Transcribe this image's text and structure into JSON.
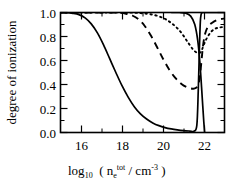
{
  "chart_data": {
    "type": "line",
    "title": "",
    "xlabel": "log10 ( n_e^tot / cm^-3 )",
    "ylabel": "degree of ionization",
    "xlim": [
      15,
      23
    ],
    "ylim": [
      0.0,
      1.0
    ],
    "grid": false,
    "legend": "none",
    "xticks": [
      16,
      18,
      20,
      22
    ],
    "xtick_labels": [
      "16",
      "18",
      "20",
      "22"
    ],
    "xminor_ticks": [
      15,
      17,
      19,
      21,
      23
    ],
    "yticks": [
      0.0,
      0.2,
      0.4,
      0.6,
      0.8,
      1.0
    ],
    "ytick_labels": [
      "0.0",
      "0.2",
      "0.4",
      "0.6",
      "0.8",
      "1.0"
    ],
    "yminor_ticks": [
      0.1,
      0.3,
      0.5,
      0.7,
      0.9
    ],
    "series": [
      {
        "name": "solid",
        "style": "solid",
        "x": [
          15.0,
          15.3,
          15.6,
          15.9,
          16.2,
          16.5,
          16.8,
          17.1,
          17.4,
          17.7,
          18.0,
          18.3,
          18.6,
          18.9,
          19.2,
          19.5,
          19.8,
          20.1,
          20.4,
          20.7,
          21.0,
          21.3,
          21.5,
          21.65,
          21.72,
          21.78,
          21.82,
          21.86,
          21.9,
          22.0,
          22.2,
          22.4,
          22.6,
          22.8,
          23.0
        ],
        "y": [
          1.0,
          0.998,
          0.993,
          0.982,
          0.955,
          0.905,
          0.83,
          0.73,
          0.615,
          0.5,
          0.39,
          0.295,
          0.215,
          0.155,
          0.112,
          0.08,
          0.057,
          0.041,
          0.03,
          0.022,
          0.016,
          0.012,
          0.01,
          0.06,
          0.35,
          0.72,
          0.92,
          0.985,
          0.998,
          1.0,
          1.0,
          1.0,
          1.0,
          1.0,
          1.0
        ]
      },
      {
        "name": "solid-descending-branch",
        "style": "solid",
        "x": [
          20.4,
          20.8,
          21.1,
          21.35,
          21.55,
          21.7,
          21.8,
          21.88,
          21.94,
          21.99,
          22.03
        ],
        "y": [
          1.0,
          1.0,
          0.995,
          0.97,
          0.9,
          0.76,
          0.58,
          0.38,
          0.22,
          0.09,
          0.0
        ]
      },
      {
        "name": "dashed",
        "style": "dashed",
        "x": [
          15.0,
          16.0,
          17.0,
          17.8,
          18.2,
          18.5,
          18.8,
          19.1,
          19.4,
          19.7,
          20.0,
          20.3,
          20.6,
          20.9,
          21.2,
          21.45,
          21.6,
          21.72,
          21.8,
          21.88,
          21.95,
          22.05,
          22.2,
          22.4,
          22.6,
          22.8,
          23.0
        ],
        "y": [
          1.0,
          1.0,
          1.0,
          0.998,
          0.99,
          0.975,
          0.945,
          0.89,
          0.81,
          0.715,
          0.615,
          0.525,
          0.455,
          0.405,
          0.375,
          0.365,
          0.37,
          0.4,
          0.47,
          0.6,
          0.72,
          0.82,
          0.885,
          0.915,
          0.935,
          0.945,
          0.95
        ]
      },
      {
        "name": "dotted",
        "style": "dotted",
        "x": [
          15.0,
          16.0,
          17.0,
          18.0,
          18.4,
          18.8,
          19.2,
          19.6,
          20.0,
          20.3,
          20.6,
          20.9,
          21.2,
          21.45,
          21.65,
          21.8,
          21.9,
          22.0,
          22.15,
          22.35,
          22.55,
          22.75,
          23.0
        ],
        "y": [
          1.0,
          1.0,
          1.0,
          1.0,
          0.999,
          0.996,
          0.99,
          0.978,
          0.955,
          0.925,
          0.885,
          0.83,
          0.755,
          0.695,
          0.665,
          0.665,
          0.69,
          0.735,
          0.79,
          0.84,
          0.865,
          0.875,
          0.88
        ]
      }
    ]
  },
  "xaxis": {
    "prefix": "log",
    "prefix_sub": "10",
    "open_paren": "(",
    "var": "n",
    "var_sub": "e",
    "var_sup": "tot",
    "slash": "/",
    "unit": "cm",
    "unit_sup": "-3",
    "close_paren": ")"
  },
  "yaxis": {
    "label": "degree of ionization"
  }
}
